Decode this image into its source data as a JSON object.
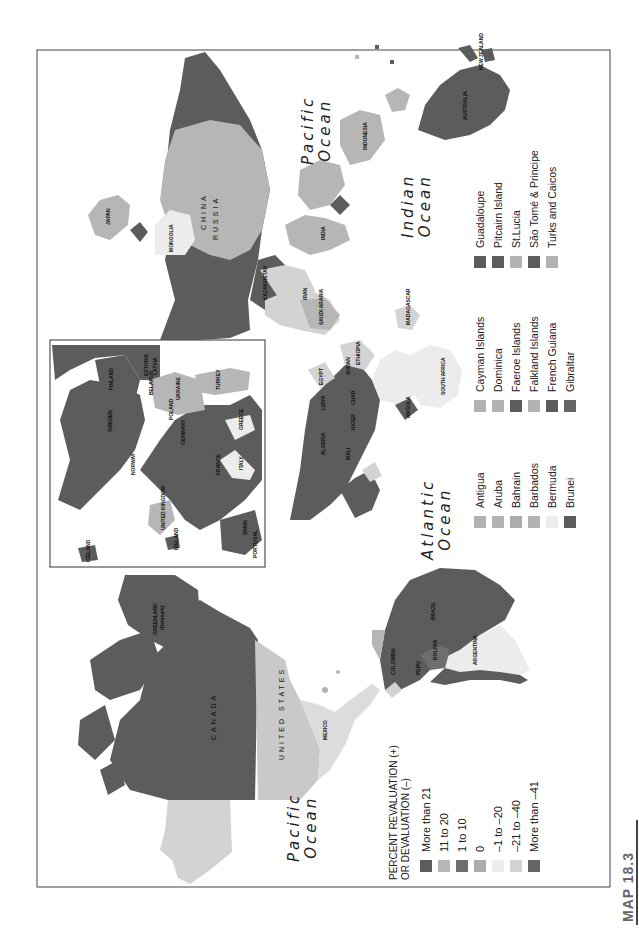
{
  "figure": {
    "label": "MAP 18.3",
    "orientation": "rotated 90° counter-clockwise"
  },
  "legend": {
    "title_line1": "PERCENT REVALUATION (+)",
    "title_line2": "OR DEVALUATION (–)",
    "items": [
      {
        "label": "More than 21",
        "color": "#5c5c5c"
      },
      {
        "label": "11 to 20",
        "color": "#b6b6b6"
      },
      {
        "label": "1 to 10",
        "color": "#6e6e6e"
      },
      {
        "label": "0",
        "color": "#adadad"
      },
      {
        "label": "–1 to –20",
        "color": "#ececec"
      },
      {
        "label": "–21 to –40",
        "color": "#d3d3d3"
      },
      {
        "label": "More than –41",
        "color": "#646464"
      }
    ]
  },
  "territories_legend": {
    "columns": [
      [
        {
          "label": "Antigua",
          "color": "#b3b3b3"
        },
        {
          "label": "Aruba",
          "color": "#b3b3b3"
        },
        {
          "label": "Bahrain",
          "color": "#adadad"
        },
        {
          "label": "Barbados",
          "color": "#b3b3b3"
        },
        {
          "label": "Bermuda",
          "color": "#ececec"
        },
        {
          "label": "Brunei",
          "color": "#5c5c5c"
        }
      ],
      [
        {
          "label": "Cayman Islands",
          "color": "#b3b3b3"
        },
        {
          "label": "Dominica",
          "color": "#b3b3b3"
        },
        {
          "label": "Faeroe Islands",
          "color": "#5c5c5c"
        },
        {
          "label": "Falkland Islands",
          "color": "#b3b3b3"
        },
        {
          "label": "French Guiana",
          "color": "#5c5c5c"
        },
        {
          "label": "Gibraltar",
          "color": "#646464"
        }
      ],
      [
        {
          "label": "Guadaloupe",
          "color": "#5c5c5c"
        },
        {
          "label": "Pitcairn Island",
          "color": "#5c5c5c"
        },
        {
          "label": "St.Lucia",
          "color": "#b3b3b3"
        },
        {
          "label": "São Tomé & Principe",
          "color": "#5c5c5c"
        },
        {
          "label": "Turks and Caicos",
          "color": "#b3b3b3"
        }
      ]
    ]
  },
  "oceans": {
    "pacific_west": [
      "Pacific",
      "Ocean"
    ],
    "pacific_east": [
      "Pacific",
      "Ocean"
    ],
    "atlantic": [
      "Atlantic",
      "Ocean"
    ],
    "indian": [
      "Indian",
      "Ocean"
    ]
  },
  "countries": {
    "canada": "CANADA",
    "united_states": "UNITED STATES",
    "mexico": "MEXICO",
    "greenland": "GREENLAND",
    "greenland_note": "(Denmark)",
    "brazil": "BRAZIL",
    "argentina": "ARGENTINA",
    "chile": "CHILE",
    "peru": "PERU",
    "bolivia": "BOLIVIA",
    "paraguay": "PARAGUAY",
    "uruguay": "URUGUAY",
    "colombia": "COLOMBIA",
    "venezuela": "VENEZ.",
    "ecuador": "ECUADOR",
    "guyana": "GUYANA",
    "suriname": "SURINAME",
    "french_guiana": "FRENCH GUIANA",
    "panama": "PANAMA",
    "costa_rica": "COSTA RICA",
    "el_salvador": "EL SALVADOR",
    "guatemala": "GUATEMALA",
    "belize": "BELIZE",
    "honduras": "HONDURAS",
    "nicaragua": "NICARAGUA",
    "cuba": "CUBA",
    "bahamas": "BAHAMAS",
    "haiti": "HAITI",
    "dominican_rep": "DOMINICAN REP.",
    "puerto_rico": "PUERTO RICO",
    "montserrat": "MONTSERRAT",
    "grenada": "GRENADA",
    "trinidad": "TRINIDAD AND TOBAGO",
    "russia": "RUSSIA",
    "mongolia": "MONGOLIA",
    "china": "CHINA",
    "japan": "JAPAN",
    "n_korea": "N. KOREA",
    "s_korea": "S. KOREA",
    "taiwan": "TAIWAN",
    "philippines": "PHILIPPINES",
    "india": "INDIA",
    "pakistan": "PAKISTAN",
    "afghanistan": "AFGH.",
    "iran": "IRAN",
    "iraq": "IRAQ",
    "nepal": "NEPAL",
    "bhutan": "BHUTAN",
    "myanmar": "MYANMAR",
    "bangladesh": "BANG.",
    "sri_lanka": "SRI LANKA",
    "maldives": "MALDIVES",
    "kazakhstan": "KAZAKHSTAN",
    "kyrgyz": "KYRGYZ REPUBLIC",
    "tajikistan": "TAJIKISTAN",
    "turkmenistan": "TURKM.",
    "uzbekistan": "UZBEK.",
    "saudi_arabia": "SAUDI ARABIA",
    "yemen": "YEMEN",
    "oman": "OMAN",
    "uae": "U.A.E.",
    "qatar": "QATAR",
    "kuwait": "KUWAIT",
    "syria": "SYRIA",
    "jordan": "JORDAN",
    "israel": "ISR.",
    "lebanon": "LEB.",
    "georgia": "GEOR.",
    "armenia": "ARM.",
    "azerbaijan": "AZER.",
    "turkey": "TURKEY",
    "malaysia": "MALAYSIA",
    "singapore": "SINGAPORE",
    "indonesia": "INDONESIA",
    "hong_kong": "HONG KONG",
    "vietnam": "VIETNAM",
    "laos": "LAOS",
    "thailand": "THAILAND",
    "cambodia": "CAMB.",
    "papua": "PAPUA NEW GUINEA",
    "guam": "GUAM",
    "australia": "AUSTRALIA",
    "new_zealand": "NEW ZEALAND",
    "new_caledonia": "NEW CALEDONIA",
    "solomon": "SOLOMON ISLANDS",
    "vanuatu": "VANUATU",
    "nauru": "NAURU",
    "kiribati": "KIRIBATI",
    "tuvalu": "TUVALU",
    "fiji": "FIJI",
    "tonga": "TONGA",
    "egypt": "EGYPT",
    "libya": "LIBYA",
    "algeria": "ALGERIA",
    "tunisia": "TUNISIA",
    "morocco": "MOROCCO",
    "western_sahara": "WESTERN SAHARA",
    "mauritania": "MAURIT.",
    "mali": "MALI",
    "niger": "NIGER",
    "chad": "CHAD",
    "sudan": "SUDAN",
    "ethiopia": "ETHIOPIA",
    "somalia": "SOMALIA",
    "kenya": "KENYA",
    "uganda": "UGA.",
    "tanzania": "TANZANIA",
    "nigeria": "NIGERIA",
    "cameroon": "CAM.",
    "car": "C.A.R.",
    "congo": "CONGO",
    "drc": "DEM. REP. OF CONGO",
    "gabon": "GABON",
    "angola": "ANGOLA",
    "zambia": "ZAMBIA",
    "zimbabwe": "ZIMB.",
    "mozambique": "MOZAM.",
    "namibia": "NAMIBIA",
    "botswana": "BOTS.",
    "south_africa": "SOUTH AFRICA",
    "swaziland": "SWAZILAND",
    "lesotho": "LESOTHO",
    "madagascar": "MADAGASCAR",
    "malawi": "MALAWI",
    "comoros": "COMOROS",
    "seychelles": "SEYCHELLES",
    "mauritius": "MAURITIUS",
    "senegal": "SENEGAL",
    "gambia": "GAMBIA",
    "guinea_bissau": "GUINEA-BISSAU",
    "guinea": "GUINEA",
    "sierra_leone": "SIERRA LEONE",
    "liberia": "LIBERIA",
    "cote_divoire": "CÔTE D'IVOIRE",
    "ghana": "GHANA",
    "togo": "TOGO",
    "benin": "BENIN",
    "eq_guinea": "EQU. GUINEA",
    "cape_verde": "CAPE VERDE",
    "iceland": "ICELAND",
    "ireland": "IRELAND",
    "united_kingdom": "UNITED KINGDOM",
    "portugal": "PORTUGAL",
    "spain": "SPAIN",
    "france": "FRANCE",
    "belgium": "BELG.",
    "netherlands": "NETH.",
    "luxembourg": "LUX.",
    "switzerland": "SWITZ.",
    "germany": "GERMANY",
    "denmark": "DEN.",
    "norway": "NORWAY",
    "sweden": "SWEDEN",
    "finland": "FINLAND",
    "estonia": "ESTONIA",
    "latvia": "LATVIA",
    "lithuania": "LITH.",
    "russia_kal": "RUS.",
    "belarus": "BELARUS",
    "poland": "POLAND",
    "czech": "CZ. REP.",
    "slovakia": "SLO.",
    "austria": "AUS.",
    "hungary": "HUN.",
    "slovenia": "SL.",
    "croatia": "CRO.",
    "bosnia": "BOS.",
    "serbia": "SER. MON.",
    "romania": "ROM.",
    "moldova": "MOLD.",
    "ukraine": "UKRAINE",
    "bulgaria": "BULG.",
    "macedonia": "MAC.",
    "albania": "ALB.",
    "greece": "GREECE",
    "italy": "ITALY",
    "malta": "MALTA",
    "monaco": "MONACO",
    "cyprus": "CYP."
  }
}
